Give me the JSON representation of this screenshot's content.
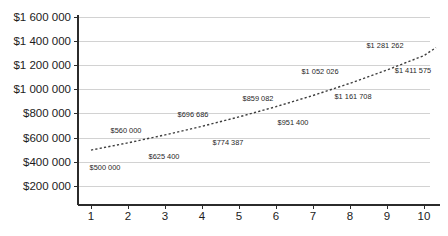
{
  "chart_data": {
    "type": "line",
    "title": "",
    "subtitle": "",
    "xlabel": "",
    "ylabel": "",
    "x": [
      1,
      2,
      3,
      4,
      5,
      6,
      7,
      8,
      9,
      10
    ],
    "categories": [
      "1",
      "2",
      "3",
      "4",
      "5",
      "6",
      "7",
      "8",
      "9",
      "10"
    ],
    "values": [
      500000,
      560000,
      625400,
      696686,
      774387,
      859082,
      951400,
      1052026,
      1161708,
      1281262
    ],
    "series": [
      {
        "name": "",
        "values": [
          500000,
          560000,
          625400,
          696686,
          774387,
          859082,
          951400,
          1052026,
          1161708,
          1281262
        ],
        "style": "dotted",
        "color": "#3d3d3d"
      }
    ],
    "data_labels": [
      "$500 000",
      "$560 000",
      "$625 400",
      "$696 686",
      "$774 387",
      "$859 082",
      "$951 400",
      "$1 052 026",
      "$1 161 708",
      "$1 281 262",
      "$1 411 575"
    ],
    "xlim": [
      0.5,
      10.6
    ],
    "ylim": [
      100000,
      1600000
    ],
    "ytick_labels": [
      "$1 600 000",
      "$1 400 000",
      "$1 200 000",
      "$1 000 000",
      "$800 000",
      "$600 000",
      "$400 000",
      "$200 000"
    ],
    "ytick_values": [
      1600000,
      1400000,
      1200000,
      1000000,
      800000,
      600000,
      400000,
      200000
    ],
    "xtick_labels": [
      "1",
      "2",
      "3",
      "4",
      "5",
      "6",
      "7",
      "8",
      "9",
      "10"
    ],
    "grid": true,
    "grid_color": "#d2d2d2",
    "legend": false,
    "legend_position": "none",
    "axis_color": "#2b2b2b",
    "background": "#ffffff",
    "annotations": [
      {
        "text": "$500 000",
        "x": 105,
        "y": 168
      },
      {
        "text": "$560 000",
        "x": 126,
        "y": 131
      },
      {
        "text": "$625 400",
        "x": 164,
        "y": 157
      },
      {
        "text": "$696 686",
        "x": 193,
        "y": 115
      },
      {
        "text": "$774 387",
        "x": 228,
        "y": 143
      },
      {
        "text": "$859 082",
        "x": 258,
        "y": 99
      },
      {
        "text": "$951 400",
        "x": 293,
        "y": 123
      },
      {
        "text": "$1 052 026",
        "x": 320,
        "y": 72
      },
      {
        "text": "$1 161 708",
        "x": 353,
        "y": 97
      },
      {
        "text": "$1 281 262",
        "x": 385,
        "y": 46
      },
      {
        "text": "$1 411 575",
        "x": 413,
        "y": 71
      }
    ]
  }
}
